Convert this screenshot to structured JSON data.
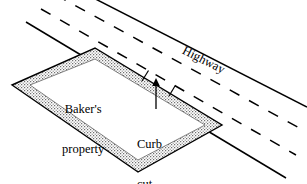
{
  "figure": {
    "kind": "property-highway-diagram",
    "background_color": "#ffffff",
    "ink_color": "#000000",
    "stipple_color": "#8a8a8a"
  },
  "labels": {
    "property_line1": "Baker's",
    "property_line2": "property",
    "curb_line1": "Curb",
    "curb_line2": "cut",
    "highway": "Highway"
  },
  "diagram_data": {
    "type": "plan-map",
    "highway": {
      "name": "Highway",
      "orientation_deg": 27,
      "edge_lines": 2,
      "edge_line_style": "solid",
      "lane_lines": 2,
      "lane_line_style": "dashed",
      "label_rotation_deg": 27
    },
    "parcel": {
      "name": "Baker's property",
      "shape": "parallelogram",
      "border_style": "stippled-band-with-outline",
      "vertices": [
        [
          12,
          85
        ],
        [
          95,
          48
        ],
        [
          222,
          125
        ],
        [
          138,
          172
        ]
      ]
    },
    "curb_cut": {
      "label": "Curb cut",
      "description": "gap in the parcel boundary opening onto the highway",
      "gap_along_edge": [
        [
          152,
          72
        ],
        [
          172,
          84
        ]
      ],
      "arrow": {
        "from": [
          156,
          108
        ],
        "to": [
          156,
          81
        ],
        "direction": "up"
      }
    }
  }
}
